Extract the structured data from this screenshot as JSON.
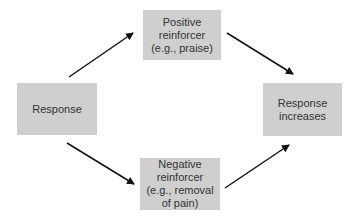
{
  "diagram": {
    "nodes": {
      "response": {
        "lines": [
          "Response"
        ]
      },
      "positive": {
        "lines": [
          "Positive",
          "reinforcer",
          "(e.g., praise)"
        ]
      },
      "negative": {
        "lines": [
          "Negative",
          "reinforcer",
          "(e.g., removal",
          "of pain)"
        ]
      },
      "outcome": {
        "lines": [
          "Response",
          "increases"
        ]
      }
    },
    "edges": [
      {
        "from": "response",
        "to": "positive"
      },
      {
        "from": "positive",
        "to": "outcome"
      },
      {
        "from": "response",
        "to": "negative"
      },
      {
        "from": "negative",
        "to": "outcome"
      }
    ],
    "colors": {
      "box": "#cfcfcf",
      "text": "#333333",
      "arrow": "#111111",
      "background": "#ffffff"
    }
  }
}
